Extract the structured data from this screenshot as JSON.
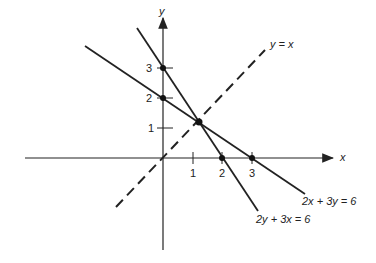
{
  "axes": {
    "x_label": "x",
    "y_label": "y"
  },
  "x_ticks": [
    "1",
    "2",
    "3"
  ],
  "y_ticks": [
    "1",
    "2",
    "3"
  ],
  "lines": [
    {
      "equation": "y = x",
      "style": "dashed"
    },
    {
      "equation": "2x + 3y = 6",
      "style": "solid"
    },
    {
      "equation": "2y + 3x = 6",
      "style": "solid"
    }
  ],
  "colors": {
    "ink": "#222222",
    "background": "#ffffff"
  }
}
